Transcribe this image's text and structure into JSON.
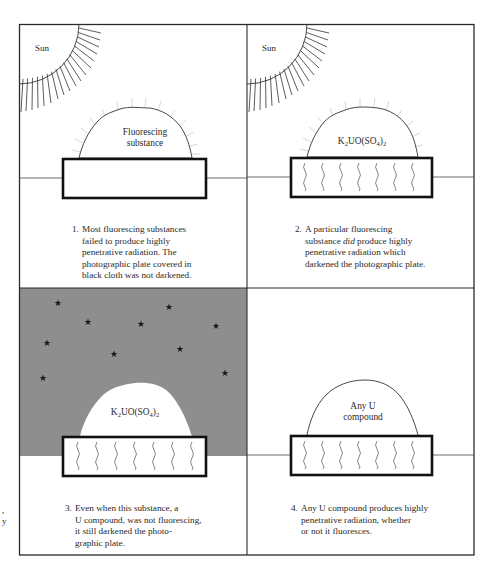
{
  "figure": {
    "colors": {
      "frame": "#2b2b2b",
      "night_sky": "#8e8e8e",
      "star": "#1a1a1a",
      "paper": "#ffffff",
      "ink": "#2a2a2a"
    },
    "panels": [
      {
        "id": 1,
        "sun_label": "Sun",
        "substance_label_line1": "Fluorescing",
        "substance_label_line2": "substance",
        "plate_darkened": false,
        "fluorescing": true,
        "caption_number": "1.",
        "caption_lines": [
          "Most fluorescing substances",
          "failed to produce highly",
          "penetrative radiation. The",
          "photographic plate covered in",
          "black cloth was not darkened."
        ]
      },
      {
        "id": 2,
        "sun_label": "Sun",
        "substance_formula": {
          "k": "K",
          "k_sub": "2",
          "mid": "UO(SO",
          "so4_sub": "4",
          "close": ")",
          "close_sub": "2"
        },
        "plate_darkened": true,
        "fluorescing": true,
        "caption_number": "2.",
        "caption_line1_pre": "A particular fluorescing",
        "caption_line2_pre": "substance ",
        "caption_line2_em": "did",
        "caption_line2_post": " produce highly",
        "caption_lines_rest": [
          "penetrative radiation which",
          "darkened the photographic plate."
        ]
      },
      {
        "id": 3,
        "night": true,
        "substance_formula": {
          "k": "K",
          "k_sub": "2",
          "mid": "UO(SO",
          "so4_sub": "4",
          "close": ")",
          "close_sub": "2"
        },
        "plate_darkened": true,
        "fluorescing": false,
        "caption_number": "3.",
        "caption_lines": [
          "Even when this substance, a",
          "U compound, was not fluorescing,",
          "it still darkened the photo-",
          "graphic plate."
        ]
      },
      {
        "id": 4,
        "substance_label_line1": "Any U",
        "substance_label_line2": "compound",
        "plate_darkened": true,
        "fluorescing": false,
        "caption_number": "4.",
        "caption_lines": [
          "Any U compound produces highly",
          "penetrative radiation, whether",
          "or not it fluoresces."
        ]
      }
    ],
    "margin_fragments": [
      ",",
      "y"
    ]
  }
}
